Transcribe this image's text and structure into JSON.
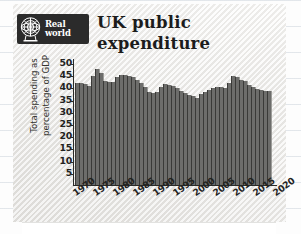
{
  "logo": {
    "badge_line1": "Real",
    "badge_line2": "world",
    "icon": "globe-icon"
  },
  "title": {
    "line1": "UK public",
    "line2": "expenditure"
  },
  "colors": {
    "bar": "#6d6d6b",
    "axis": "#2a2a28",
    "badge_bg": "#2b2b2b",
    "paper": "#f2f1ef",
    "text": "#23231f"
  },
  "chart_data": {
    "type": "bar",
    "title": "UK public expenditure",
    "xlabel": "",
    "ylabel": "Total spending as percentage of GDP",
    "ylabel_line1": "Total spending as",
    "ylabel_line2": "percentage of GDP",
    "ylim": [
      0,
      52
    ],
    "yticks": [
      50,
      45,
      40,
      35,
      30,
      25,
      20,
      15,
      10,
      5
    ],
    "xtick_labels": [
      "1970",
      "1975",
      "1980",
      "1985",
      "1990",
      "1995",
      "2000",
      "2005",
      "2010",
      "2015",
      "2020"
    ],
    "xtick_years": [
      1970,
      1975,
      1980,
      1985,
      1990,
      1995,
      2000,
      2005,
      2010,
      2015,
      2020
    ],
    "grid": false,
    "legend": null,
    "categories": [
      1970,
      1971,
      1972,
      1973,
      1974,
      1975,
      1976,
      1977,
      1978,
      1979,
      1980,
      1981,
      1982,
      1983,
      1984,
      1985,
      1986,
      1987,
      1988,
      1989,
      1990,
      1991,
      1992,
      1993,
      1994,
      1995,
      1996,
      1997,
      1998,
      1999,
      2000,
      2001,
      2002,
      2003,
      2004,
      2005,
      2006,
      2007,
      2008,
      2009,
      2010,
      2011,
      2012,
      2013,
      2014,
      2015,
      2016,
      2017,
      2018
    ],
    "values": [
      42.0,
      42.2,
      41.6,
      41.0,
      44.8,
      48.0,
      46.4,
      42.8,
      42.4,
      42.6,
      44.6,
      45.2,
      45.6,
      44.8,
      44.6,
      43.4,
      42.2,
      40.6,
      38.4,
      37.8,
      38.2,
      40.4,
      41.6,
      41.4,
      40.8,
      40.2,
      39.0,
      37.8,
      37.0,
      36.6,
      36.0,
      37.4,
      38.2,
      39.4,
      40.0,
      40.6,
      40.4,
      40.2,
      42.2,
      45.0,
      44.6,
      43.4,
      42.8,
      41.4,
      40.6,
      39.8,
      39.2,
      38.8,
      38.6
    ]
  }
}
